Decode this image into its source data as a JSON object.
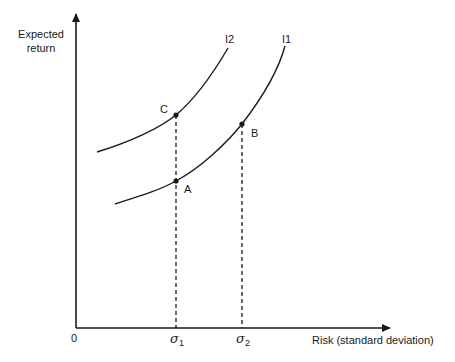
{
  "diagram": {
    "y_axis_label_line1": "Expected",
    "y_axis_label_line2": "return",
    "x_axis_label": "Risk (standard deviation)",
    "origin_label": "0",
    "curves": [
      {
        "id": "I2",
        "label": "I2"
      },
      {
        "id": "I1",
        "label": "I1"
      }
    ],
    "points": [
      {
        "id": "C",
        "label": "C",
        "curve": "I2",
        "risk": "σ1"
      },
      {
        "id": "A",
        "label": "A",
        "curve": "I1",
        "risk": "σ1"
      },
      {
        "id": "B",
        "label": "B",
        "curve": "I1",
        "risk": "σ2"
      }
    ],
    "ticks": [
      {
        "symbol": "σ",
        "subscript": "1"
      },
      {
        "symbol": "σ",
        "subscript": "2"
      }
    ],
    "colors": {
      "line": "#1a1a1a",
      "background": "#ffffff"
    }
  }
}
